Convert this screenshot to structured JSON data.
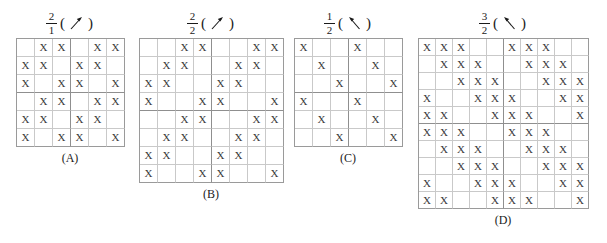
{
  "figure": {
    "panels": [
      {
        "id": "A",
        "caption": "(A)",
        "ratio_numerator": "2",
        "ratio_denominator": "1",
        "arrow": "arrow-up-right",
        "left": 16,
        "top": 8,
        "cell": 18,
        "cols": 6,
        "rows": 6,
        "tile_cols": 3,
        "tile_rows": 3,
        "mark": "X",
        "rows_data": [
          [
            0,
            1,
            1,
            0,
            1,
            1
          ],
          [
            1,
            1,
            0,
            1,
            1,
            0
          ],
          [
            1,
            0,
            1,
            1,
            0,
            1
          ],
          [
            0,
            1,
            1,
            0,
            1,
            1
          ],
          [
            1,
            1,
            0,
            1,
            1,
            0
          ],
          [
            1,
            0,
            1,
            1,
            0,
            1
          ]
        ]
      },
      {
        "id": "B",
        "caption": "(B)",
        "ratio_numerator": "2",
        "ratio_denominator": "2",
        "arrow": "arrow-up-right",
        "left": 139,
        "top": 8,
        "cell": 18,
        "cols": 8,
        "rows": 8,
        "tile_cols": 4,
        "tile_rows": 4,
        "mark": "X",
        "rows_data": [
          [
            0,
            0,
            1,
            1,
            0,
            0,
            1,
            1
          ],
          [
            0,
            1,
            1,
            0,
            0,
            1,
            1,
            0
          ],
          [
            1,
            1,
            0,
            0,
            1,
            1,
            0,
            0
          ],
          [
            1,
            0,
            0,
            1,
            1,
            0,
            0,
            1
          ],
          [
            0,
            0,
            1,
            1,
            0,
            0,
            1,
            1
          ],
          [
            0,
            1,
            1,
            0,
            0,
            1,
            1,
            0
          ],
          [
            1,
            1,
            0,
            0,
            1,
            1,
            0,
            0
          ],
          [
            1,
            0,
            0,
            1,
            1,
            0,
            0,
            1
          ]
        ]
      },
      {
        "id": "C",
        "caption": "(C)",
        "ratio_numerator": "1",
        "ratio_denominator": "2",
        "arrow": "arrow-up-left",
        "left": 294,
        "top": 8,
        "cell": 18,
        "cols": 6,
        "rows": 6,
        "tile_cols": 3,
        "tile_rows": 3,
        "mark": "X",
        "rows_data": [
          [
            1,
            0,
            0,
            1,
            0,
            0
          ],
          [
            0,
            1,
            0,
            0,
            1,
            0
          ],
          [
            0,
            0,
            1,
            0,
            0,
            1
          ],
          [
            1,
            0,
            0,
            1,
            0,
            0
          ],
          [
            0,
            1,
            0,
            0,
            1,
            0
          ],
          [
            0,
            0,
            1,
            0,
            0,
            1
          ]
        ]
      },
      {
        "id": "D",
        "caption": "(D)",
        "ratio_numerator": "3",
        "ratio_denominator": "2",
        "arrow": "arrow-up-left",
        "left": 418,
        "top": 8,
        "cell": 17,
        "cols": 10,
        "rows": 10,
        "tile_cols": 5,
        "tile_rows": 5,
        "mark": "X",
        "rows_data": [
          [
            1,
            1,
            1,
            0,
            0,
            1,
            1,
            1,
            0,
            0
          ],
          [
            0,
            1,
            1,
            1,
            0,
            0,
            1,
            1,
            1,
            0
          ],
          [
            0,
            0,
            1,
            1,
            1,
            0,
            0,
            1,
            1,
            1
          ],
          [
            1,
            0,
            0,
            1,
            1,
            1,
            0,
            0,
            1,
            1
          ],
          [
            1,
            1,
            0,
            0,
            1,
            1,
            1,
            0,
            0,
            1
          ],
          [
            1,
            1,
            1,
            0,
            0,
            1,
            1,
            1,
            0,
            0
          ],
          [
            0,
            1,
            1,
            1,
            0,
            0,
            1,
            1,
            1,
            0
          ],
          [
            0,
            0,
            1,
            1,
            1,
            0,
            0,
            1,
            1,
            1
          ],
          [
            1,
            0,
            0,
            1,
            1,
            1,
            0,
            0,
            1,
            1
          ],
          [
            1,
            1,
            0,
            0,
            1,
            1,
            1,
            0,
            0,
            1
          ]
        ]
      }
    ]
  }
}
